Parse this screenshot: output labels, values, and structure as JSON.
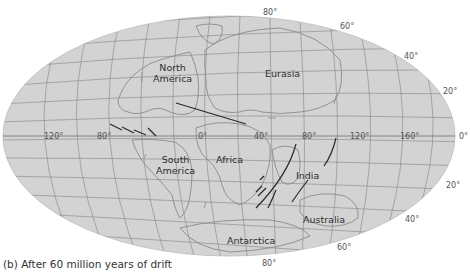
{
  "caption": "(b) After 60 million years of drift",
  "projection": {
    "type": "Mollweide-style world map",
    "fill_color": "#d2d2d2",
    "grid_color": "#7a7a7a",
    "coast_color": "#8c8c8c",
    "ridge_color": "#2a2a2a"
  },
  "continents": {
    "north_america": [
      "North",
      "America"
    ],
    "eurasia": "Eurasia",
    "south_america": [
      "South",
      "America"
    ],
    "africa": "Africa",
    "india": "India",
    "australia": "Australia",
    "antarctica": "Antarctica"
  },
  "longitude_labels": {
    "w120": "120°",
    "w80": "80°",
    "zero": "0°",
    "e40": "40°",
    "e80": "80°",
    "e120": "120°",
    "e160": "160°",
    "edge0": "0°"
  },
  "latitude_labels": {
    "n80": "80°",
    "n60": "60°",
    "n40": "40°",
    "n20": "20°",
    "s20": "20°",
    "s40": "40°",
    "s60": "60°",
    "s80": "80°"
  }
}
